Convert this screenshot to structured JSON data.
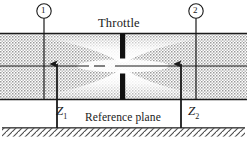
{
  "figure": {
    "type": "engineering-schematic"
  },
  "labels": {
    "throttle": "Throttle",
    "reference_plane": "Reference plane",
    "z1": "Z",
    "z1_sub": "1",
    "z2": "Z",
    "z2_sub": "2",
    "station_1": "1",
    "station_2": "2"
  },
  "colors": {
    "line": "#1a1a1a",
    "fill_stipple": "#9a9a9a",
    "background": "#ffffff",
    "jet_light": "#ffffff",
    "hatch": "#4a4a4a"
  },
  "geometry": {
    "pipe_top_y": 33,
    "pipe_bottom_y": 100,
    "centerline_y": 66,
    "ground_y": 128,
    "throttle_x": 123,
    "station_1_x": 44,
    "station_2_x": 196,
    "arrow_left_x": 57,
    "arrow_right_x": 181
  }
}
